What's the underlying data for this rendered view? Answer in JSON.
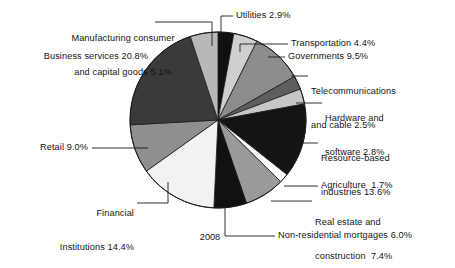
{
  "figure": {
    "caption": "2008",
    "center_x": 218,
    "center_y": 120,
    "radius": 88
  },
  "chart_data": {
    "type": "pie",
    "title": "",
    "subtitle": "",
    "xlabel": "",
    "ylabel": "",
    "caption": "2008",
    "legend_position": "none",
    "grid": false,
    "units": "percent",
    "total": 100.0,
    "start_angle_deg": 0,
    "direction": "clockwise",
    "categories": [
      "Utilities",
      "Transportation",
      "Governments",
      "Telecommunications and cable",
      "Hardware and software",
      "Resource-based industries",
      "Agriculture",
      "Real estate and construction",
      "Non-residential mortgages",
      "Financial Institutions",
      "Retail",
      "Business services",
      "Manufacturing consumer and capital goods"
    ],
    "values": [
      2.9,
      4.4,
      9.5,
      2.5,
      2.8,
      13.6,
      1.7,
      7.4,
      6.0,
      14.4,
      9.0,
      20.8,
      5.1
    ],
    "colors": [
      "#101010",
      "#cfcfcf",
      "#8c8c8c",
      "#5e5e5e",
      "#c7c7c7",
      "#141414",
      "#ffffff",
      "#9a9a9a",
      "#111111",
      "#f2f2f2",
      "#8f8f8f",
      "#3a3a3a",
      "#b8b8b8"
    ],
    "slices": [
      {
        "label": "Utilities",
        "value": 2.9,
        "value_text": "2.9%",
        "color": "#101010"
      },
      {
        "label": "Transportation",
        "value": 4.4,
        "value_text": "4.4%",
        "color": "#cfcfcf"
      },
      {
        "label": "Governments",
        "value": 9.5,
        "value_text": "9.5%",
        "color": "#8c8c8c"
      },
      {
        "label": "Telecommunications and cable",
        "value": 2.5,
        "value_text": "2.5%",
        "color": "#5e5e5e"
      },
      {
        "label": "Hardware and software",
        "value": 2.8,
        "value_text": "2.8%",
        "color": "#c7c7c7"
      },
      {
        "label": "Resource-based industries",
        "value": 13.6,
        "value_text": "13.6%",
        "color": "#141414"
      },
      {
        "label": "Agriculture",
        "value": 1.7,
        "value_text": "1.7%",
        "color": "#ffffff"
      },
      {
        "label": "Real estate and construction",
        "value": 7.4,
        "value_text": "7.4%",
        "color": "#9a9a9a"
      },
      {
        "label": "Non-residential mortgages",
        "value": 6.0,
        "value_text": "6.0%",
        "color": "#111111"
      },
      {
        "label": "Financial Institutions",
        "value": 14.4,
        "value_text": "14.4%",
        "color": "#f2f2f2"
      },
      {
        "label": "Retail",
        "value": 9.0,
        "value_text": "9.0%",
        "color": "#8f8f8f"
      },
      {
        "label": "Business services",
        "value": 20.8,
        "value_text": "20.8%",
        "color": "#3a3a3a"
      },
      {
        "label": "Manufacturing consumer and capital goods",
        "value": 5.1,
        "value_text": "5.1%",
        "color": "#b8b8b8"
      }
    ]
  },
  "labels": {
    "manufacturing_line1": "Manufacturing consumer",
    "manufacturing_line2": "and capital goods 5.1%",
    "utilities": "Utilities 2.9%",
    "transportation": "Transportation 4.4%",
    "governments": "Governments 9.5%",
    "telecom_line1": "Telecommunications",
    "telecom_line2": "and cable 2.5%",
    "hardware_line1": "Hardware and",
    "hardware_line2": "software 2.8%",
    "business_services": "Business services 20.8%",
    "resource_line1": "Resource-based",
    "resource_line2": "industries 13.6%",
    "agriculture": "Agriculture  1.7%",
    "real_estate_line1": "Real estate and",
    "real_estate_line2": "construction  7.4%",
    "non_residential": "Non-residential mortgages 6.0%",
    "retail": "Retail 9.0%",
    "financial_line1": "Financial",
    "financial_line2": "Institutions 14.4%"
  }
}
